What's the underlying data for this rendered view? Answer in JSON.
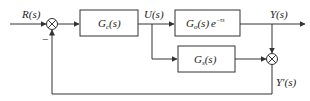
{
  "diagram": {
    "type": "block-diagram",
    "title": "",
    "signals": {
      "input": "R(s)",
      "control": "U(s)",
      "output": "Y(s)",
      "feedback": "Y'(s)"
    },
    "blocks": [
      {
        "id": "controller",
        "main": "G",
        "subscript": "c",
        "arg": "(s)",
        "suffix": ""
      },
      {
        "id": "plant",
        "main": "G",
        "subscript": "o",
        "arg": "(s)",
        "suffix": "e",
        "exponent": "−τs"
      },
      {
        "id": "compensator",
        "main": "G",
        "subscript": "s",
        "arg": "(s)",
        "suffix": ""
      }
    ],
    "summing_junctions": [
      {
        "id": "error-sum",
        "signs": {
          "feedback": "−"
        }
      },
      {
        "id": "output-sum",
        "signs": {}
      }
    ],
    "colors": {
      "line": "#333333",
      "background": "#ffffff",
      "text": "#1a1a1a"
    }
  }
}
